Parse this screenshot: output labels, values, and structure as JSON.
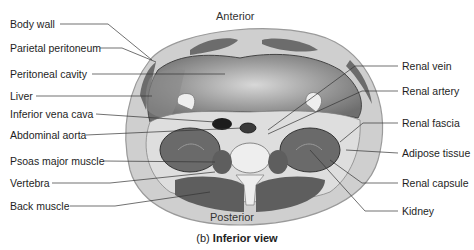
{
  "figure": {
    "orientation_top": "Anterior",
    "orientation_bottom": "Posterior",
    "caption_prefix": "(b)",
    "caption_bold": "Inferior view"
  },
  "labels_left": [
    {
      "text": "Body wall",
      "x": 10,
      "y": 18
    },
    {
      "text": "Parietal peritoneum",
      "x": 10,
      "y": 42
    },
    {
      "text": "Peritoneal cavity",
      "x": 10,
      "y": 68
    },
    {
      "text": "Liver",
      "x": 10,
      "y": 90
    },
    {
      "text": "Inferior vena cava",
      "x": 10,
      "y": 108
    },
    {
      "text": "Abdominal aorta",
      "x": 10,
      "y": 129
    },
    {
      "text": "Psoas major muscle",
      "x": 10,
      "y": 155
    },
    {
      "text": "Vertebra",
      "x": 10,
      "y": 177
    },
    {
      "text": "Back muscle",
      "x": 10,
      "y": 200
    }
  ],
  "labels_right": [
    {
      "text": "Renal vein",
      "x": 402,
      "y": 60
    },
    {
      "text": "Renal artery",
      "x": 402,
      "y": 85
    },
    {
      "text": "Renal fascia",
      "x": 402,
      "y": 117
    },
    {
      "text": "Adipose tissue",
      "x": 402,
      "y": 147
    },
    {
      "text": "Renal capsule",
      "x": 402,
      "y": 177
    },
    {
      "text": "Kidney",
      "x": 402,
      "y": 205
    }
  ],
  "colors": {
    "body_outline": "#9a9a9a",
    "body_wall": "#c9c9c9",
    "cavity": "#8c8c8c",
    "cavity_highlight": "#d4d4d4",
    "muscle": "#5e5e5e",
    "fat": "#dcdcdc",
    "bone": "#eeeeee",
    "kidney": "#6a6a6a",
    "vessel": "#1c1c1c",
    "leader_line": "#333333"
  }
}
